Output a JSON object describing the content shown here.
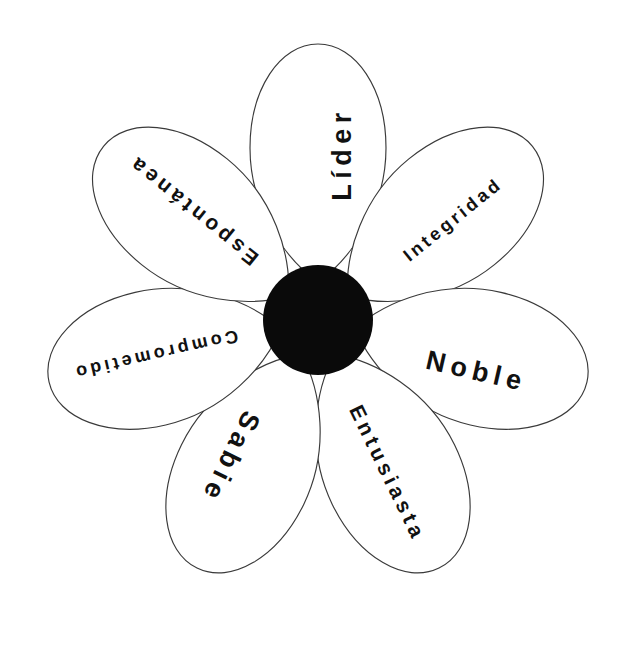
{
  "diagram": {
    "type": "daisy-petal-diagram",
    "title": "",
    "center": {
      "label": "",
      "color": "#0a0a0a",
      "shape": "filled-circle"
    },
    "colors": {
      "background": "#ffffff",
      "petal_fill": "#ffffff",
      "petal_stroke": "#3a3a3a",
      "center_fill": "#0a0a0a",
      "text": "#111111"
    },
    "petals": [
      {
        "id": "petal-lider",
        "label": "Líder",
        "position": "top",
        "angle_deg": 0,
        "text_size": "large"
      },
      {
        "id": "petal-integridad",
        "label": "Integridad",
        "position": "upper-right",
        "angle_deg": 51,
        "text_size": "xsmall"
      },
      {
        "id": "petal-noble",
        "label": "Noble",
        "position": "right",
        "angle_deg": 103,
        "text_size": "large"
      },
      {
        "id": "petal-entusiasta",
        "label": "Entusiasta",
        "position": "lower-right",
        "angle_deg": 154,
        "text_size": "small"
      },
      {
        "id": "petal-sabie",
        "label": "Sabie",
        "position": "lower-left",
        "angle_deg": 206,
        "text_size": "large"
      },
      {
        "id": "petal-comprometido",
        "label": "Comprometido",
        "position": "left",
        "angle_deg": 257,
        "text_size": "xsmall"
      },
      {
        "id": "petal-espontanea",
        "label": "Espontánea",
        "position": "upper-left",
        "angle_deg": 309,
        "text_size": "small"
      }
    ]
  }
}
